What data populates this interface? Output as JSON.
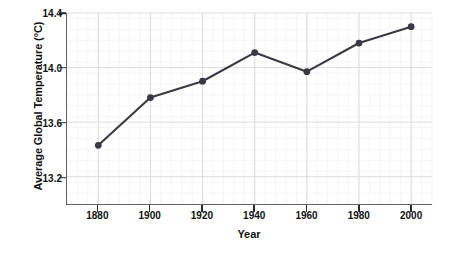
{
  "chart_data": {
    "type": "line",
    "title": "",
    "xlabel": "Year",
    "ylabel": "Average Global Temperature (°C)",
    "x": [
      1880,
      1900,
      1920,
      1940,
      1960,
      1980,
      2000
    ],
    "categories": [
      "1880",
      "1900",
      "1920",
      "1940",
      "1960",
      "1980",
      "2000"
    ],
    "values": [
      13.43,
      13.78,
      13.9,
      14.11,
      13.97,
      14.18,
      14.3
    ],
    "series": [
      {
        "name": "Average Global Temperature",
        "values": [
          13.43,
          13.78,
          13.9,
          14.11,
          13.97,
          14.18,
          14.3
        ]
      }
    ],
    "xlim": [
      1868,
      2008
    ],
    "ylim": [
      13.0,
      14.4
    ],
    "xticks": [
      1880,
      1900,
      1920,
      1940,
      1960,
      1980,
      2000
    ],
    "xtick_labels": [
      "1880",
      "1900",
      "1920",
      "1940",
      "1960",
      "1980",
      "2000"
    ],
    "yticks": [
      13.2,
      13.6,
      14.0,
      14.4
    ],
    "ytick_labels": [
      "13.2",
      "13.6",
      "14.0",
      "14.4"
    ],
    "grid": true,
    "minor_grid": true,
    "legend": false,
    "legend_position": "none",
    "marker": "circle",
    "line_color": "#3a3a44",
    "marker_color": "#3a3a44",
    "grid_color": "#d8d8de",
    "minor_grid_color": "#eeeef2",
    "axis_color": "#2b2b2b",
    "background_color": "#ffffff"
  }
}
